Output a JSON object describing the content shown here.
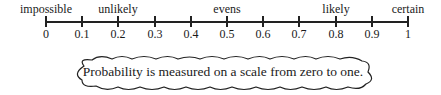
{
  "scale": {
    "min": 0,
    "max": 1,
    "ticks": [
      {
        "value": 0,
        "label": "0",
        "x": 46
      },
      {
        "value": 0.1,
        "label": "0.1",
        "x": 82
      },
      {
        "value": 0.2,
        "label": "0.2",
        "x": 118
      },
      {
        "value": 0.3,
        "label": "0.3",
        "x": 155
      },
      {
        "value": 0.4,
        "label": "0.4",
        "x": 191
      },
      {
        "value": 0.5,
        "label": "0.5",
        "x": 227
      },
      {
        "value": 0.6,
        "label": "0.6",
        "x": 263
      },
      {
        "value": 0.7,
        "label": "0.7",
        "x": 299
      },
      {
        "value": 0.8,
        "label": "0.8",
        "x": 336
      },
      {
        "value": 0.9,
        "label": "0.9",
        "x": 372
      },
      {
        "value": 1,
        "label": "1",
        "x": 408
      }
    ],
    "words": [
      {
        "value": 0,
        "label": "impossible",
        "x": 46
      },
      {
        "value": 0.2,
        "label": "unlikely",
        "x": 118
      },
      {
        "value": 0.5,
        "label": "evens",
        "x": 227
      },
      {
        "value": 0.8,
        "label": "likely",
        "x": 336
      },
      {
        "value": 1,
        "label": "certain",
        "x": 408
      }
    ]
  },
  "callout": {
    "text": "Probability is measured on a scale from zero to one."
  }
}
